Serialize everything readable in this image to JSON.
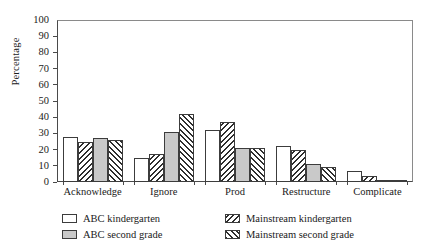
{
  "chart_data": {
    "type": "bar",
    "title": "",
    "xlabel": "",
    "ylabel": "Percentage",
    "ylim": [
      0,
      100
    ],
    "yticks": [
      0,
      10,
      20,
      30,
      40,
      50,
      60,
      70,
      80,
      90,
      100
    ],
    "grid": false,
    "legend_position": "bottom",
    "categories": [
      "Acknowledge",
      "Ignore",
      "Prod",
      "Restructure",
      "Complicate"
    ],
    "series": [
      {
        "name": "ABC kindergarten",
        "pattern": "solid-white",
        "values": [
          28,
          15,
          32,
          22,
          7
        ]
      },
      {
        "name": "Mainstream kindergarten",
        "pattern": "back-hatch",
        "values": [
          25,
          17,
          37,
          20,
          4
        ]
      },
      {
        "name": "ABC second grade",
        "pattern": "gray-stipple",
        "values": [
          27,
          31,
          21,
          11,
          1
        ]
      },
      {
        "name": "Mainstream second grade",
        "pattern": "forward-hatch",
        "values": [
          26,
          42,
          21,
          9,
          1
        ]
      }
    ]
  },
  "legend": {
    "items": [
      {
        "label": "ABC kindergarten",
        "swatch": "solid-white"
      },
      {
        "label": "Mainstream kindergarten",
        "swatch": "back-hatch"
      },
      {
        "label": "ABC second grade",
        "swatch": "gray-stipple"
      },
      {
        "label": "Mainstream second grade",
        "swatch": "forward-hatch"
      }
    ]
  }
}
